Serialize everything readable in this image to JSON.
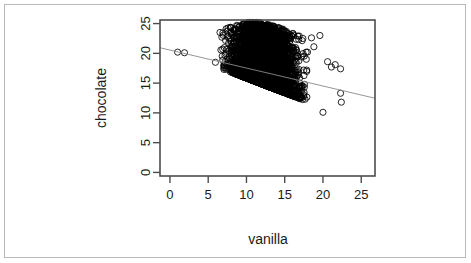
{
  "figure": {
    "background_color": "#ffffff",
    "frame_color": "#b9b9b9",
    "plot_box_color": "#4d4d4d",
    "point_color": "#000000",
    "line_color": "#808080"
  },
  "chart_data": {
    "type": "scatter",
    "title": "",
    "xlabel": "vanilla",
    "ylabel": "chocolate",
    "xlim": [
      -1.3,
      26.8
    ],
    "ylim": [
      -0.6,
      25.6
    ],
    "xticks": [
      0,
      5,
      10,
      15,
      20,
      25
    ],
    "yticks": [
      0,
      5,
      10,
      15,
      20,
      25
    ],
    "xtick_labels": [
      "0",
      "5",
      "10",
      "15",
      "20",
      "25"
    ],
    "ytick_labels": [
      "0",
      "5",
      "10",
      "15",
      "20",
      "25"
    ],
    "grid": false,
    "legend": null,
    "marker": "open-circle",
    "marker_size": 3.1,
    "n_points_approx": 4200,
    "cloud": {
      "x_range": [
        2.4,
        22.4
      ],
      "y_range": [
        10.0,
        25.4
      ],
      "core_x_range": [
        4.0,
        19.0
      ],
      "lower_edge_line": {
        "x0": 3.2,
        "y0": 19.2,
        "x1": 18.6,
        "y1": 11.6
      },
      "upper_edge_points": [
        {
          "x": 3.2,
          "y": 20.4
        },
        {
          "x": 5.0,
          "y": 22.6
        },
        {
          "x": 7.0,
          "y": 24.2
        },
        {
          "x": 9.0,
          "y": 25.0
        },
        {
          "x": 11.0,
          "y": 25.3
        },
        {
          "x": 13.0,
          "y": 24.8
        },
        {
          "x": 15.0,
          "y": 24.0
        },
        {
          "x": 17.0,
          "y": 23.0
        },
        {
          "x": 19.0,
          "y": 21.6
        },
        {
          "x": 20.5,
          "y": 19.5
        }
      ]
    },
    "outliers": [
      {
        "x": 1.0,
        "y": 20.2
      },
      {
        "x": 1.9,
        "y": 20.1
      },
      {
        "x": 20.6,
        "y": 18.6
      },
      {
        "x": 21.1,
        "y": 17.7
      },
      {
        "x": 21.6,
        "y": 18.1
      },
      {
        "x": 22.3,
        "y": 17.4
      },
      {
        "x": 22.3,
        "y": 13.3
      },
      {
        "x": 22.4,
        "y": 11.8
      },
      {
        "x": 20.0,
        "y": 10.1
      },
      {
        "x": 19.6,
        "y": 23.0
      },
      {
        "x": 18.5,
        "y": 22.6
      }
    ],
    "fit_line": {
      "label": "linear fit",
      "intercept": 20.55,
      "slope": -0.302,
      "x_start": -1.3,
      "x_end": 26.8,
      "y_start": 20.94,
      "y_end": 12.46
    },
    "series": [
      {
        "name": "observations",
        "marker": "open-circle",
        "color": "#000000"
      }
    ]
  }
}
